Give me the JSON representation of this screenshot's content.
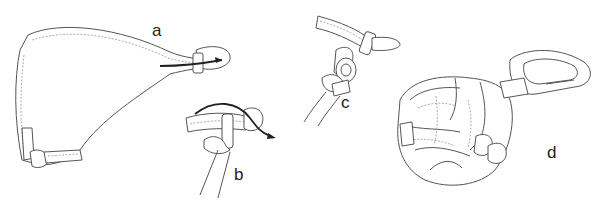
{
  "figure": {
    "panels": [
      {
        "id": "a",
        "label": "a",
        "x": 152,
        "y": 22
      },
      {
        "id": "b",
        "label": "b",
        "x": 234,
        "y": 166
      },
      {
        "id": "c",
        "label": "c",
        "x": 341,
        "y": 94
      },
      {
        "id": "d",
        "label": "d",
        "x": 547,
        "y": 144
      }
    ],
    "colors": {
      "line": "#555555",
      "arrow": "#222222",
      "background": "#ffffff"
    }
  }
}
